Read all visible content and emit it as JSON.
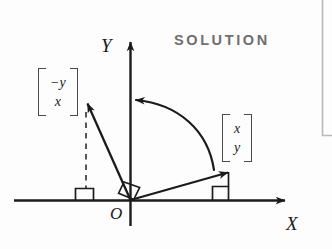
{
  "figure": {
    "caption_label": "SOLUTION",
    "accent_gray": "#6f6f6f",
    "ink_color": "#1b1b1b",
    "background": "#fdfdfd",
    "axes": {
      "x_label": "X",
      "y_label": "Y",
      "origin_label": "O"
    },
    "vectors": [
      {
        "id": "original-vector",
        "label_rows": [
          "x",
          "y"
        ],
        "description": "original vector pointing up-right into the first quadrant",
        "start": [
          130,
          200
        ],
        "end": [
          228,
          172
        ]
      },
      {
        "id": "rotated-vector",
        "label_rows": [
          "−y",
          "x"
        ],
        "description": "vector rotated 90 degrees counterclockwise, pointing up-left into the second quadrant",
        "start": [
          130,
          200
        ],
        "end": [
          88,
          103
        ]
      }
    ],
    "rotation_arc": {
      "id": "rotation-arc",
      "direction": "counterclockwise",
      "angle_degrees": 90
    },
    "right_angle_markers": [
      {
        "id": "right-angle-at-origin"
      },
      {
        "id": "right-angle-x-foot-right"
      },
      {
        "id": "right-angle-x-foot-left"
      }
    ],
    "dashed_guide": {
      "id": "projection-dashed-line",
      "style": "dashed"
    },
    "corner_rule": {
      "id": "margin-corner-rule",
      "color": "#b9b9b9"
    }
  }
}
